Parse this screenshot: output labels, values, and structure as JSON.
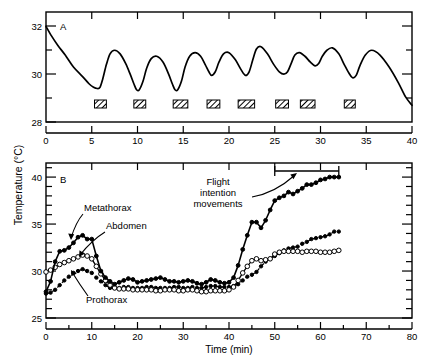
{
  "figure": {
    "axis_label_y": "Temperature  (°C)",
    "axis_label_x": "Time  (min)"
  },
  "chart_data": [
    {
      "type": "line",
      "panel": "A",
      "title": "",
      "xlabel": "",
      "ylabel": "Temperature (°C)",
      "xlim": [
        0,
        40
      ],
      "ylim": [
        28,
        32.6
      ],
      "xticks": [
        0,
        5,
        10,
        15,
        20,
        25,
        30,
        35,
        40
      ],
      "xtick_labels": [
        "0",
        "5",
        "10",
        "15",
        "20",
        "25",
        "30",
        "35",
        "40"
      ],
      "yticks": [
        28,
        29,
        30,
        31,
        32
      ],
      "ytick_labels": [
        "28",
        "",
        "30",
        "",
        "32"
      ],
      "grid": false,
      "legend": "none",
      "series": [
        {
          "name": "thoracic temperature",
          "marker": "none",
          "line": "solid",
          "x": [
            0,
            0.6,
            1.3,
            2.1,
            3.0,
            4.0,
            4.7,
            5.2,
            5.6,
            5.9,
            6.2,
            6.6,
            7.0,
            7.5,
            8.1,
            8.7,
            9.2,
            9.6,
            9.9,
            10.2,
            10.6,
            11.0,
            11.5,
            12.1,
            12.8,
            13.4,
            13.8,
            14.1,
            14.4,
            14.8,
            15.2,
            15.7,
            16.3,
            16.9,
            17.4,
            17.8,
            18.1,
            18.5,
            18.9,
            19.4,
            20.0,
            20.7,
            21.3,
            21.8,
            22.2,
            22.6,
            23.0,
            23.5,
            24.2,
            24.9,
            25.5,
            26.0,
            26.4,
            26.8,
            27.2,
            27.7,
            28.3,
            28.9,
            29.4,
            29.8,
            30.2,
            30.7,
            31.3,
            32.0,
            32.6,
            33.1,
            33.5,
            33.9,
            34.3,
            34.9,
            35.6,
            36.5,
            37.5,
            38.5,
            39.3,
            40.0
          ],
          "y": [
            32.0,
            31.6,
            31.2,
            30.8,
            30.3,
            29.9,
            29.6,
            29.45,
            29.4,
            29.45,
            29.8,
            30.4,
            30.85,
            31.0,
            30.85,
            30.45,
            30.0,
            29.6,
            29.35,
            29.35,
            29.7,
            30.25,
            30.65,
            30.75,
            30.5,
            30.0,
            29.6,
            29.35,
            29.35,
            29.7,
            30.3,
            30.75,
            30.9,
            30.75,
            30.4,
            30.1,
            29.95,
            30.1,
            30.5,
            30.85,
            30.9,
            30.6,
            30.2,
            29.95,
            30.1,
            30.6,
            31.05,
            31.15,
            30.85,
            30.4,
            30.1,
            30.0,
            30.1,
            30.45,
            30.8,
            30.9,
            30.75,
            30.5,
            30.35,
            30.45,
            30.75,
            31.0,
            31.1,
            30.85,
            30.4,
            30.05,
            29.85,
            29.95,
            30.35,
            30.8,
            31.0,
            30.8,
            30.3,
            29.65,
            29.05,
            28.7
          ]
        }
      ],
      "annotations": {
        "panel_letter": "A",
        "bars_label": "hatched bars",
        "bars": [
          {
            "start": 5.3,
            "end": 6.6
          },
          {
            "start": 9.6,
            "end": 10.9
          },
          {
            "start": 13.9,
            "end": 15.5
          },
          {
            "start": 17.6,
            "end": 19.0
          },
          {
            "start": 21.0,
            "end": 22.8
          },
          {
            "start": 25.1,
            "end": 26.5
          },
          {
            "start": 27.8,
            "end": 29.4
          },
          {
            "start": 32.6,
            "end": 33.8
          }
        ]
      }
    },
    {
      "type": "line",
      "panel": "B",
      "title": "",
      "xlabel": "Time  (min)",
      "ylabel": "Temperature (°C)",
      "xlim": [
        0,
        80
      ],
      "ylim": [
        25,
        41.5
      ],
      "xticks": [
        0,
        10,
        20,
        30,
        40,
        50,
        60,
        70,
        80
      ],
      "xtick_labels": [
        "0",
        "10",
        "20",
        "30",
        "40",
        "50",
        "60",
        "70",
        "80"
      ],
      "yticks": [
        25,
        30,
        35,
        40
      ],
      "ytick_labels": [
        "25",
        "30",
        "35",
        "40"
      ],
      "grid": false,
      "legend": "inline-labels",
      "series": [
        {
          "name": "Metathorax",
          "marker": "filled-circle",
          "line": "solid",
          "x": [
            0,
            1,
            2,
            3,
            4,
            5,
            6,
            7,
            8,
            9,
            10,
            11,
            12,
            13,
            14,
            15,
            16,
            17,
            18,
            19,
            20,
            21,
            22,
            23,
            24,
            25,
            26,
            27,
            28,
            29,
            30,
            31,
            32,
            33,
            34,
            35,
            36,
            37,
            38,
            39,
            40,
            41,
            42,
            43,
            44,
            45,
            46,
            47,
            48,
            49,
            50,
            51,
            52,
            53,
            54,
            55,
            56,
            57,
            58,
            59,
            60,
            61,
            62,
            63,
            64
          ],
          "y": [
            27.8,
            28.9,
            31.0,
            32.1,
            32.2,
            32.5,
            33.0,
            33.6,
            33.8,
            33.4,
            33.4,
            31.6,
            30.0,
            29.3,
            28.9,
            28.6,
            28.8,
            29.0,
            29.2,
            29.1,
            28.8,
            28.9,
            29.0,
            29.1,
            29.2,
            29.3,
            29.1,
            28.9,
            28.9,
            28.8,
            28.9,
            29.0,
            28.9,
            28.7,
            28.6,
            28.8,
            29.1,
            29.0,
            28.8,
            28.7,
            28.8,
            29.3,
            30.6,
            32.3,
            33.8,
            35.2,
            35.2,
            34.6,
            35.4,
            36.5,
            37.5,
            37.8,
            38.0,
            38.4,
            38.2,
            38.5,
            38.8,
            39.2,
            39.2,
            39.4,
            39.7,
            39.8,
            40.0,
            40.0,
            40.0
          ]
        },
        {
          "name": "Abdomen",
          "marker": "open-circle",
          "line": "solid",
          "x": [
            0,
            1,
            2,
            3,
            4,
            5,
            6,
            7,
            8,
            9,
            10,
            11,
            12,
            13,
            14,
            15,
            16,
            17,
            18,
            19,
            20,
            21,
            22,
            23,
            24,
            25,
            26,
            27,
            28,
            29,
            30,
            31,
            32,
            33,
            34,
            35,
            36,
            37,
            38,
            39,
            40,
            41,
            42,
            43,
            44,
            45,
            46,
            47,
            48,
            49,
            50,
            51,
            52,
            53,
            54,
            55,
            56,
            57,
            58,
            59,
            60,
            61,
            62,
            63,
            64
          ],
          "y": [
            29.9,
            30.1,
            30.4,
            30.7,
            30.9,
            31.1,
            31.3,
            31.5,
            31.7,
            31.6,
            31.3,
            30.5,
            29.7,
            29.0,
            28.5,
            28.2,
            28.1,
            28.1,
            28.1,
            28.0,
            28.0,
            28.0,
            28.0,
            28.0,
            27.9,
            27.9,
            28.0,
            28.0,
            28.0,
            27.9,
            27.9,
            28.0,
            28.0,
            27.9,
            27.8,
            27.8,
            27.9,
            27.9,
            27.9,
            27.9,
            28.0,
            28.3,
            29.0,
            29.8,
            30.5,
            31.1,
            31.3,
            31.1,
            31.2,
            31.3,
            31.8,
            32.0,
            32.1,
            32.1,
            32.1,
            32.1,
            32.0,
            32.1,
            32.1,
            32.1,
            32.0,
            32.0,
            32.0,
            32.1,
            32.2
          ]
        },
        {
          "name": "Prothorax",
          "marker": "filled-circle",
          "line": "dashed",
          "x": [
            0,
            1,
            2,
            3,
            4,
            5,
            6,
            7,
            8,
            9,
            10,
            11,
            12,
            13,
            14,
            15,
            16,
            17,
            18,
            19,
            20,
            21,
            22,
            23,
            24,
            25,
            26,
            27,
            28,
            29,
            30,
            31,
            32,
            33,
            34,
            35,
            36,
            37,
            38,
            39,
            40,
            41,
            42,
            43,
            44,
            45,
            46,
            47,
            48,
            49,
            50,
            51,
            52,
            53,
            54,
            55,
            56,
            57,
            58,
            59,
            60,
            61,
            62,
            63,
            64
          ],
          "y": [
            27.6,
            27.7,
            28.0,
            28.5,
            29.0,
            29.4,
            29.8,
            30.0,
            30.2,
            30.0,
            29.8,
            29.3,
            28.9,
            28.5,
            28.2,
            28.2,
            28.2,
            28.3,
            28.3,
            28.2,
            28.2,
            28.2,
            28.3,
            28.3,
            28.2,
            28.2,
            28.2,
            28.2,
            28.3,
            28.3,
            28.2,
            28.2,
            28.3,
            28.2,
            28.2,
            28.3,
            28.4,
            28.4,
            28.3,
            28.3,
            28.3,
            28.4,
            28.6,
            29.0,
            29.4,
            29.6,
            29.9,
            30.5,
            31.0,
            31.3,
            31.6,
            31.9,
            32.2,
            32.4,
            32.5,
            32.6,
            32.9,
            33.1,
            33.4,
            33.5,
            33.6,
            33.7,
            33.9,
            34.2,
            34.2
          ]
        }
      ],
      "annotations": {
        "panel_letter": "B",
        "series_labels": [
          "Metathorax",
          "Abdomen",
          "Prothorax"
        ],
        "callout": {
          "text_lines": [
            "Flight",
            "intention",
            "movements"
          ],
          "bracket_start": 50,
          "bracket_end": 64
        }
      }
    }
  ]
}
